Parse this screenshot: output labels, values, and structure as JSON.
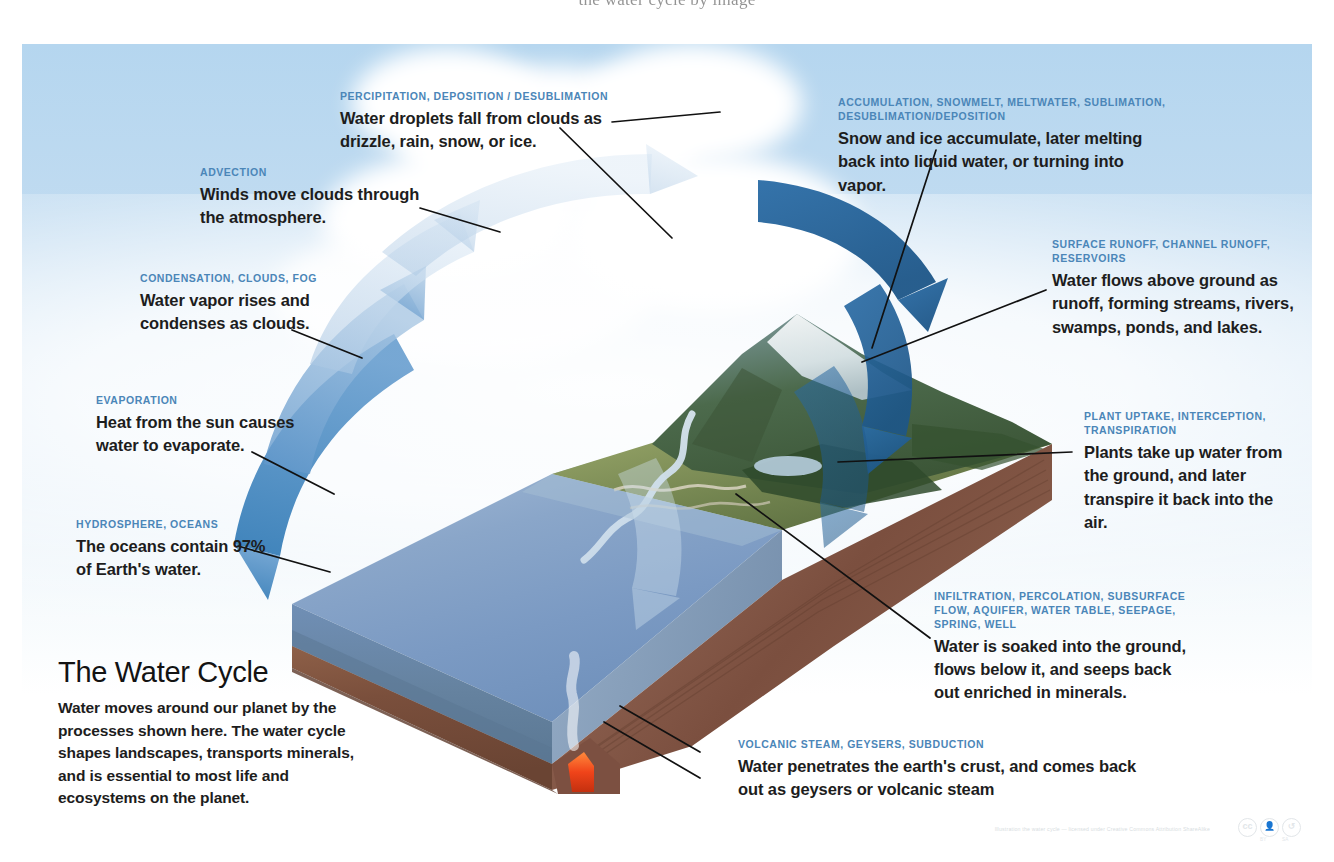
{
  "page": {
    "top_cropped_caption": "the water cycle by image",
    "background_color": "#ffffff",
    "sky_color": "#b5d6ef",
    "kicker_color": "#4b86b8",
    "body_text_color": "#1d1d1d",
    "ocean_color": "#7d9cc4",
    "arrow_light_color": "#bcd2e8",
    "arrow_mid_color": "#5e95c9",
    "arrow_dark_color": "#2b6ca3",
    "lava_color": "#f04e1e",
    "rock_color": "#8a5a47"
  },
  "title_block": {
    "name": "the-water-cycle-title",
    "title": "The Water Cycle",
    "description": "Water moves around our planet by the processes shown here. The water cycle shapes landscapes, transports minerals, and is essential to most life and ecosystems on the planet."
  },
  "labels": [
    {
      "id": "precipitation",
      "kicker": "PERCIPITATION, DEPOSITION / DESUBLIMATION",
      "body": "Water droplets fall from clouds as drizzle, rain, snow, or ice."
    },
    {
      "id": "accumulation",
      "kicker": "ACCUMULATION, SNOWMELT, MELTWATER, SUBLIMATION, DESUBLIMATION/DEPOSITION",
      "body": "Snow and ice accumulate, later melting back into liquid water, or turning into vapor."
    },
    {
      "id": "advection",
      "kicker": "ADVECTION",
      "body": "Winds move clouds through the atmosphere."
    },
    {
      "id": "condensation",
      "kicker": "CONDENSATION, CLOUDS, FOG",
      "body": "Water vapor rises and condenses as clouds."
    },
    {
      "id": "evaporation",
      "kicker": "EVAPORATION",
      "body": "Heat from the sun causes water to evaporate."
    },
    {
      "id": "hydrosphere",
      "kicker": "HYDROSPHERE, OCEANS",
      "body": "The oceans contain 97% of Earth's water."
    },
    {
      "id": "surface-runoff",
      "kicker": "SURFACE RUNOFF, CHANNEL RUNOFF, RESERVOIRS",
      "body": "Water flows above ground as runoff, forming streams, rivers, swamps, ponds, and lakes."
    },
    {
      "id": "plant-uptake",
      "kicker": "PLANT UPTAKE, INTERCEPTION, TRANSPIRATION",
      "body": "Plants take up water from the ground, and later transpire it back into the air."
    },
    {
      "id": "infiltration",
      "kicker": "INFILTRATION, PERCOLATION, SUBSURFACE FLOW, AQUIFER, WATER TABLE, SEEPAGE, SPRING, WELL",
      "body": "Water is soaked into the ground, flows below it, and seeps back out enriched in minerals."
    },
    {
      "id": "volcanic",
      "kicker": "VOLCANIC STEAM, GEYSERS, SUBDUCTION",
      "body": "Water penetrates the earth's crust, and comes back out as geysers or volcanic steam"
    }
  ],
  "license": {
    "credit_line": "Illustration the water cycle — licensed under Creative Commons Attribution ShareAlike",
    "badges": [
      "cc",
      "by",
      "sa"
    ],
    "by_caption": "BY",
    "sa_caption": "SA"
  }
}
